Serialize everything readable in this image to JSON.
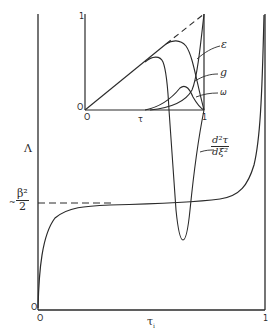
{
  "main_plot": {
    "y_axis_label": "Λ",
    "x_axis_label": "τ",
    "x_axis_subscript": "i",
    "y_origin_label": "O",
    "x_origin_label": "O",
    "x_end_label": "1",
    "asymptote_prefix": "~",
    "asymptote_num": "β²",
    "asymptote_den": "2",
    "curve_label_num": "d²τ",
    "curve_label_den": "dξ²"
  },
  "inset_plot": {
    "y_top_label": "1",
    "y_origin_label": "O",
    "x_origin_label": "O",
    "x_axis_label": "τ",
    "x_end_label": "1",
    "curve_labels": {
      "epsilon": "ε",
      "g": "g",
      "omega": "ω"
    }
  },
  "colors": {
    "ink": "#2a2a2a",
    "background": "#ffffff"
  }
}
